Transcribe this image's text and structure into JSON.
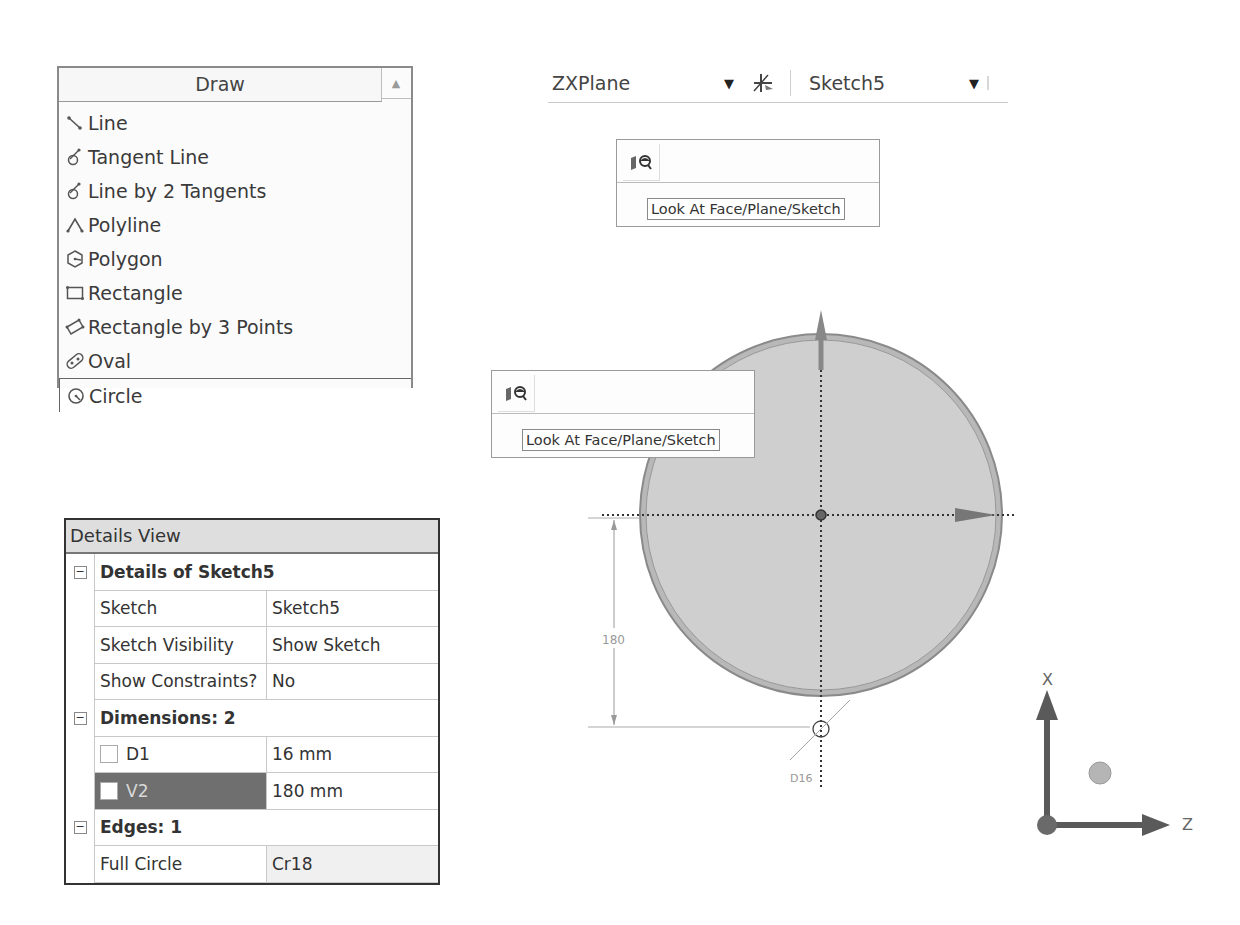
{
  "draw_panel": {
    "title": "Draw",
    "scroll_up_icon": "▲",
    "items": [
      {
        "label": "Line",
        "icon": "line-icon"
      },
      {
        "label": "Tangent Line",
        "icon": "tangent-line-icon"
      },
      {
        "label": "Line by 2 Tangents",
        "icon": "line-by-2-tangents-icon"
      },
      {
        "label": "Polyline",
        "icon": "polyline-icon"
      },
      {
        "label": "Polygon",
        "icon": "polygon-icon"
      },
      {
        "label": "Rectangle",
        "icon": "rectangle-icon"
      },
      {
        "label": "Rectangle by 3 Points",
        "icon": "rectangle-3-points-icon"
      },
      {
        "label": "Oval",
        "icon": "oval-icon"
      },
      {
        "label": "Circle",
        "icon": "circle-icon",
        "selected": true
      }
    ]
  },
  "toolbar": {
    "plane_combo": {
      "value": "ZXPlane",
      "caret": "▼"
    },
    "new_sketch_icon": "new-sketch-icon",
    "sketch_combo": {
      "value": "Sketch5",
      "caret": "▼"
    }
  },
  "look_at": {
    "icon": "look-at-icon",
    "tooltip": "Look At Face/Plane/Sketch"
  },
  "details_view": {
    "title": "Details View",
    "groups": [
      {
        "label": "Details of Sketch5",
        "collapse": "−",
        "rows": [
          {
            "name": "Sketch",
            "value": "Sketch5"
          },
          {
            "name": "Sketch Visibility",
            "value": "Show Sketch"
          },
          {
            "name": "Show Constraints?",
            "value": "No"
          }
        ]
      },
      {
        "label": "Dimensions: 2",
        "collapse": "−",
        "rows": [
          {
            "name": "D1",
            "value": "16 mm",
            "checkbox": true,
            "selected": false
          },
          {
            "name": "V2",
            "value": "180 mm",
            "checkbox": true,
            "selected": true
          }
        ]
      },
      {
        "label": "Edges: 1",
        "collapse": "−",
        "rows": [
          {
            "name": "Full Circle",
            "value": "Cr18"
          }
        ]
      }
    ]
  },
  "viewport": {
    "dimension_vertical": "180",
    "dimension_diameter": "D16",
    "colors": {
      "fill": "#cfcfcf",
      "rim": "#9a9a9a",
      "axis": "#555555"
    }
  },
  "triad": {
    "x_label": "X",
    "z_label": "Z",
    "colors": {
      "arrow": "#5a5a5a",
      "ball": "#b5b5b5"
    }
  }
}
